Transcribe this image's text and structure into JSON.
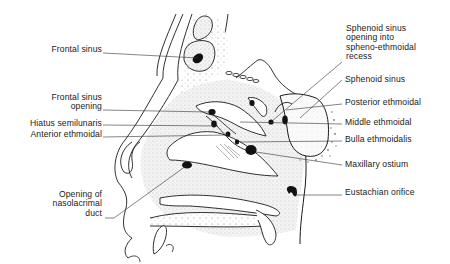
{
  "figure": {
    "colors": {
      "ink": "#1a1a1a",
      "background": "#ffffff",
      "stipple": "#9a9a9a",
      "shaded": "#f1f1f1"
    },
    "labels_left": [
      {
        "id": "frontal-sinus",
        "lines": [
          "Frontal sinus"
        ]
      },
      {
        "id": "frontal-sinus-opening",
        "lines": [
          "Frontal sinus",
          "opening"
        ]
      },
      {
        "id": "hiatus-semilunaris",
        "lines": [
          "Hiatus semilunaris"
        ]
      },
      {
        "id": "anterior-ethmoidal",
        "lines": [
          "Anterior ethmoidal"
        ]
      },
      {
        "id": "opening-nasolacrimal-duct",
        "lines": [
          "Opening of",
          "nasolacrimal",
          "duct"
        ]
      }
    ],
    "labels_right": [
      {
        "id": "sphenoid-sinus-opening",
        "lines": [
          "Sphenoid sinus",
          "opening into",
          "spheno-ethmoidal",
          "recess"
        ]
      },
      {
        "id": "sphenoid-sinus",
        "lines": [
          "Sphenoid sinus"
        ]
      },
      {
        "id": "posterior-ethmoidal",
        "lines": [
          "Posterior ethmoidal"
        ]
      },
      {
        "id": "middle-ethmoidal",
        "lines": [
          "Middle ethmoidal"
        ]
      },
      {
        "id": "bulla-ethmoidalis",
        "lines": [
          "Bulla ethmoidalis"
        ]
      },
      {
        "id": "maxillary-ostium",
        "lines": [
          "Maxillary ostium"
        ]
      },
      {
        "id": "eustachian-orifice",
        "lines": [
          "Eustachian orifice"
        ]
      }
    ]
  }
}
